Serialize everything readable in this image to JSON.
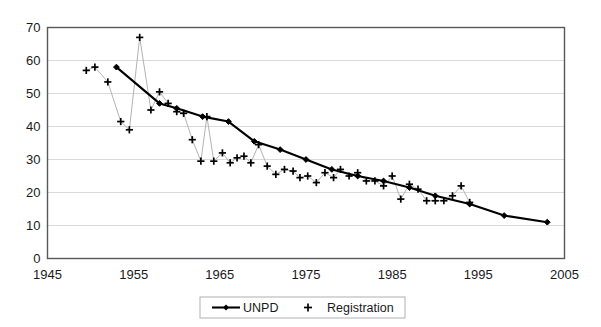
{
  "chart_data": {
    "type": "line",
    "title": "",
    "xlabel": "",
    "ylabel": "",
    "xlim": [
      1945,
      2005
    ],
    "ylim": [
      0,
      70
    ],
    "xticks": [
      1945,
      1955,
      1965,
      1975,
      1985,
      1995,
      2005
    ],
    "yticks": [
      0,
      10,
      20,
      30,
      40,
      50,
      60,
      70
    ],
    "grid": "horizontal",
    "legend_position": "bottom-center",
    "series": [
      {
        "name": "UNPD",
        "marker": "diamond",
        "line": "solid",
        "color": "#000000",
        "x": [
          1953,
          1958,
          1960,
          1963,
          1966,
          1969,
          1972,
          1975,
          1978,
          1981,
          1984,
          1987,
          1990,
          1994,
          1998,
          2003
        ],
        "values": [
          58,
          47,
          45.5,
          43,
          41.5,
          35.5,
          33,
          30,
          27,
          25,
          23.5,
          21.5,
          19,
          16.5,
          13,
          11
        ]
      },
      {
        "name": "Registration",
        "marker": "plus",
        "line": "thin-grey",
        "color": "#000000",
        "x": [
          1949.5,
          1950.5,
          1952,
          1953.5,
          1954.5,
          1955.7,
          1957,
          1958,
          1959,
          1960,
          1960.8,
          1961.8,
          1962.8,
          1963.5,
          1964.3,
          1965.3,
          1966.2,
          1967,
          1967.8,
          1968.6,
          1969.5,
          1970.5,
          1971.5,
          1972.5,
          1973.5,
          1974.3,
          1975.2,
          1976.2,
          1977.2,
          1978.2,
          1979,
          1980,
          1981,
          1982,
          1983,
          1984,
          1985,
          1986,
          1987,
          1988,
          1989,
          1990,
          1991,
          1992,
          1993,
          1994
        ],
        "values": [
          57,
          58,
          53.5,
          41.5,
          39,
          67,
          45,
          50.5,
          47,
          44.5,
          44,
          36,
          29.5,
          43,
          29.5,
          32,
          29,
          30.5,
          31,
          29,
          34.5,
          28,
          25.5,
          27,
          26.5,
          24.5,
          25,
          23,
          26,
          24.5,
          27,
          25,
          26,
          23.5,
          23.5,
          22,
          25,
          18,
          22.5,
          21,
          17.5,
          17.5,
          17.5,
          19,
          22,
          17
        ]
      }
    ]
  },
  "legend": {
    "entries": [
      {
        "label": "UNPD",
        "symbol": "line-diamond"
      },
      {
        "label": "Registration",
        "symbol": "plus"
      }
    ]
  },
  "axes": {
    "y_tick_labels": [
      "0",
      "10",
      "20",
      "30",
      "40",
      "50",
      "60",
      "70"
    ],
    "x_tick_labels": [
      "1945",
      "1955",
      "1965",
      "1975",
      "1985",
      "1995",
      "2005"
    ]
  }
}
